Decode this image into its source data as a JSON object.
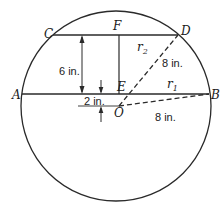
{
  "diagram": {
    "type": "geometry",
    "points": {
      "A": "A",
      "B": "B",
      "C": "C",
      "D": "D",
      "E": "E",
      "F": "F",
      "O": "O"
    },
    "radii": {
      "r1": {
        "name": "r",
        "sub": "1"
      },
      "r2": {
        "name": "r",
        "sub": "2"
      }
    },
    "dimensions": {
      "chord_spacing": "6 in.",
      "center_offset": "2 in.",
      "radius_OD": "8 in.",
      "radius_OB": "8 in."
    },
    "colors": {
      "stroke": "#2a2a2a",
      "text": "#1a1a1a",
      "background": "#ffffff"
    }
  }
}
